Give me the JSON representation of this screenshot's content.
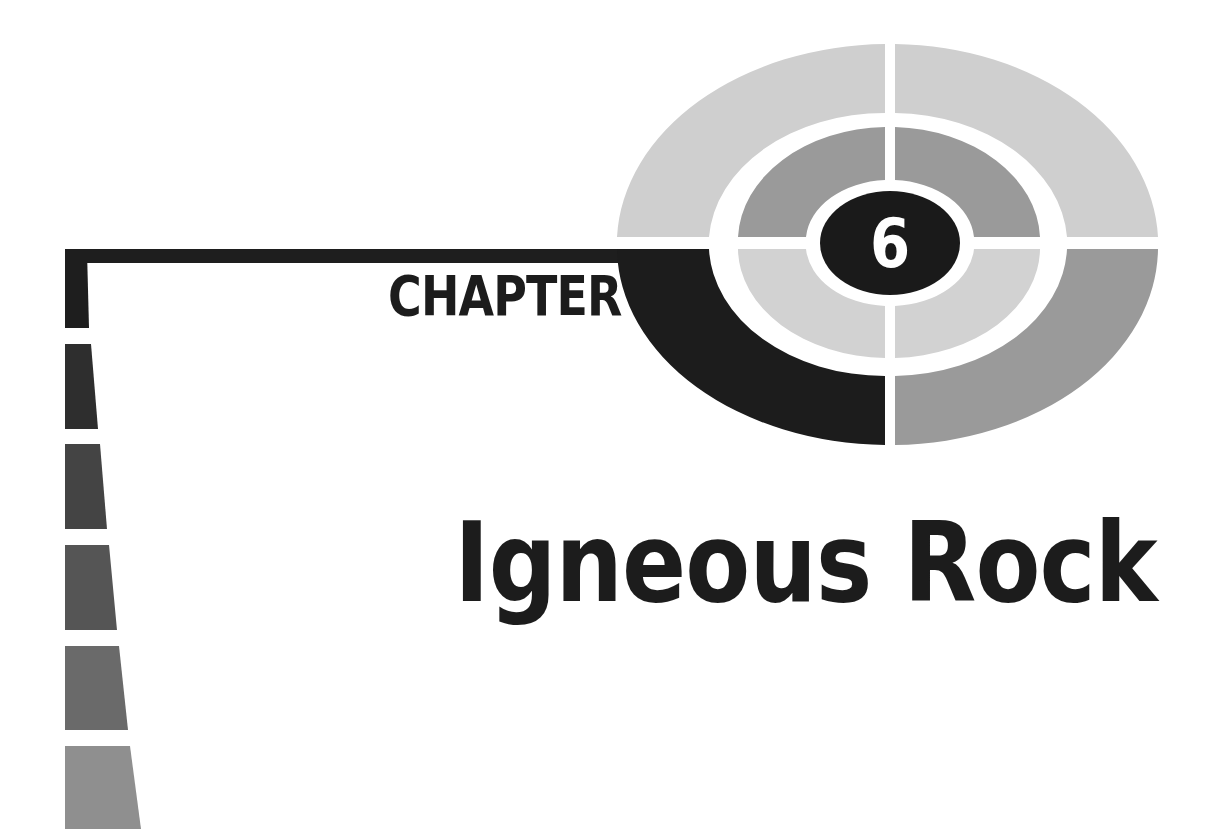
{
  "page": {
    "type": "chapter-opener"
  },
  "chapter": {
    "label": "CHAPTER",
    "number": "6",
    "title": "Igneous Rock"
  },
  "colors": {
    "background": "#ffffff",
    "text": "#1c1c1c",
    "number_text": "#ffffff",
    "target_outer_light": "#cfcfcf",
    "target_outer_dark_quadrant": "#1c1c1c",
    "target_outer_medium_quadrant": "#9a9a9a",
    "target_middle_top": "#9a9a9a",
    "target_middle_bottom": "#d2d2d2",
    "target_center": "#1a1a1a",
    "stripes": [
      "#1e1e1e",
      "#2e2e2e",
      "#444444",
      "#555555",
      "#6a6a6a",
      "#8f8f8f"
    ]
  }
}
